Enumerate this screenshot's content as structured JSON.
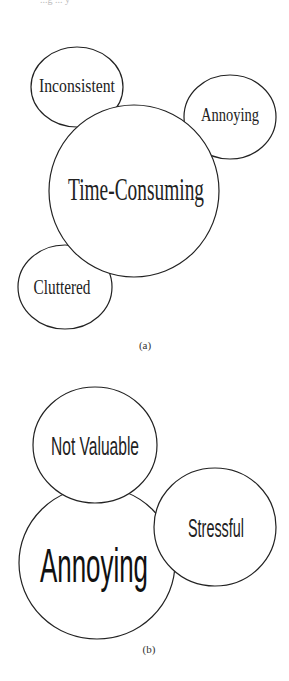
{
  "top_fragment": "...g ... y",
  "diagrams": [
    {
      "caption": "(a)",
      "bubbles": [
        {
          "label": "Inconsistent",
          "cx": 77,
          "cy": 87,
          "rx": 46,
          "ry": 40,
          "size": 19
        },
        {
          "label": "Annoying",
          "cx": 230,
          "cy": 117,
          "rx": 46,
          "ry": 42,
          "size": 18
        },
        {
          "label": "Time-Consuming",
          "cx": 134,
          "cy": 191,
          "rx": 85,
          "ry": 86,
          "size": 30
        },
        {
          "label": "Cluttered",
          "cx": 65,
          "cy": 287,
          "rx": 47,
          "ry": 42,
          "size": 19
        }
      ]
    },
    {
      "caption": "(b)",
      "bubbles": [
        {
          "label": "Annoying",
          "cx": 97,
          "cy": 563,
          "rx": 78,
          "ry": 76,
          "size": 44
        },
        {
          "label": "Not Valuable",
          "cx": 95,
          "cy": 445,
          "rx": 62,
          "ry": 58,
          "size": 24
        },
        {
          "label": "Stressful",
          "cx": 215,
          "cy": 527,
          "rx": 61,
          "ry": 59,
          "size": 24
        }
      ]
    }
  ]
}
